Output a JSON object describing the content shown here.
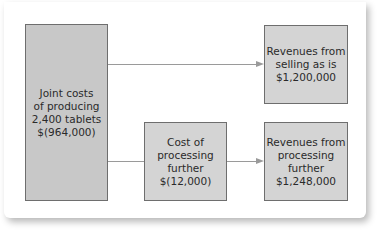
{
  "diagram": {
    "joint_costs": {
      "label": "Joint costs\nof producing\n2,400 tablets\n$(964,000)"
    },
    "cost_processing": {
      "label": "Cost of\nprocessing\nfurther\n$(12,000)"
    },
    "revenue_as_is": {
      "label": "Revenues from\nselling as is\n$1,200,000"
    },
    "revenue_processed": {
      "label": "Revenues from\nprocessing\nfurther\n$1,248,000"
    },
    "colors": {
      "box_fill": "#d4d4d4",
      "box_border": "#6e6e6e",
      "connector": "#9a9a9a"
    }
  }
}
